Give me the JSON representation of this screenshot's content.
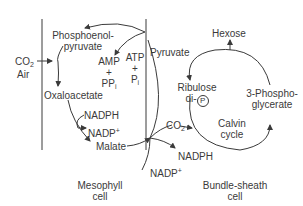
{
  "diagram": {
    "cells": {
      "mesophyll": {
        "line1": "Mesophyll",
        "line2": "cell"
      },
      "bundle_sheath": {
        "line1": "Bundle-sheath",
        "line2": "cell"
      }
    },
    "inputs": {
      "co2": "CO",
      "co2_sub": "2",
      "air": "Air"
    },
    "metabolites": {
      "pep_line1": "Phosphoenol-",
      "pep_line2": "pyruvate",
      "oxaloacetate": "Oxaloacetate",
      "malate": "Malate",
      "pyruvate": "Pyruvate",
      "hexose": "Hexose",
      "rubp_line1": "Ribulose",
      "rubp_line2": "di-",
      "rubp_p": "P",
      "pga_line1": "3-Phospho-",
      "pga_line2": "glycerate"
    },
    "cofactors": {
      "amp": "AMP",
      "plus1": "+",
      "ppi": "PP",
      "ppi_sub": "i",
      "atp": "ATP",
      "plus2": "+",
      "pi": "P",
      "pi_sub": "i",
      "nadph_meso": "NADPH",
      "nadp_meso": "NADP",
      "nadp_meso_sup": "+",
      "co2_bs": "CO",
      "co2_bs_sub": "2",
      "nadph_bs": "NADPH",
      "nadp_bs": "NADP",
      "nadp_bs_sup": "+"
    },
    "calvin": {
      "line1": "Calvin",
      "line2": "cycle"
    },
    "colors": {
      "ink": "#3a3a3a",
      "background": "#ffffff"
    }
  }
}
